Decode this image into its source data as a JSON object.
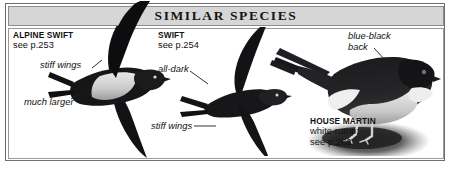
{
  "panel": {
    "title": "SIMILAR SPECIES",
    "border_color": "#6e6e6e",
    "header_bg": "#d6d6d6",
    "body_bg": "#ffffff",
    "ink_color": "#111111"
  },
  "species": [
    {
      "id": "alpine-swift",
      "name": "ALPINE SWIFT",
      "reference": "see p.253",
      "pose": "in flight, underside",
      "annotations": [
        {
          "id": "stiff-wings-alpine",
          "text": "stiff wings"
        },
        {
          "id": "much-larger",
          "text": "much larger"
        }
      ]
    },
    {
      "id": "swift",
      "name": "SWIFT",
      "reference": "see p.254",
      "pose": "in flight, underside",
      "annotations": [
        {
          "id": "all-dark",
          "text": "all-dark"
        },
        {
          "id": "stiff-wings-swift",
          "text": "stiff wings"
        }
      ]
    },
    {
      "id": "house-martin",
      "name": "HOUSE MARTIN",
      "reference_line_1": "white rump;",
      "reference_line_2": "see p.282",
      "pose": "perched, side view on mud",
      "annotations": [
        {
          "id": "blue-black-back-line-1",
          "text": "blue-black"
        },
        {
          "id": "blue-black-back-line-2",
          "text": "back"
        }
      ]
    }
  ],
  "icons": {
    "alpine_swift": "alpine-swift-silhouette",
    "swift": "swift-silhouette",
    "house_martin": "house-martin-illustration"
  }
}
